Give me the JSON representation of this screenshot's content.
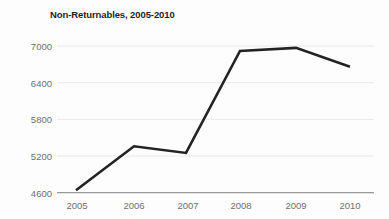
{
  "chart_data": {
    "type": "line",
    "title": "Non-Returnables, 2005-2010",
    "xlabel": "",
    "ylabel": "",
    "categories": [
      "2005",
      "2006",
      "2007",
      "2008",
      "2009",
      "2010"
    ],
    "x": [
      2005,
      2006,
      2007,
      2008,
      2009,
      2010
    ],
    "values": [
      4640,
      5360,
      5250,
      6920,
      6970,
      6660
    ],
    "series": [
      {
        "name": "Non-Returnables",
        "values": [
          4640,
          5360,
          5250,
          6920,
          6970,
          6660
        ]
      }
    ],
    "ylim": [
      4600,
      7000
    ],
    "yticks": [
      4600,
      5200,
      5800,
      6400,
      7000
    ],
    "ytick_labels": [
      "4600",
      "5200",
      "5800",
      "6400",
      "7000"
    ],
    "xtick_labels": [
      "2005",
      "2006",
      "2007",
      "2008",
      "2009",
      "2010"
    ],
    "grid": true,
    "grid_axis": "y",
    "legend": false,
    "legend_position": "none",
    "markers": false,
    "colors": {
      "line": "#232323",
      "grid": "#e9e9e9",
      "axis": "#9a9a9a",
      "tick_text": "#6e6e6e",
      "title_text": "#1d1d1d",
      "background": "#fdfdfd"
    },
    "line_width": 2.6
  },
  "geometry": {
    "plot_left": 57,
    "plot_right": 374,
    "y_top_value_px": 46,
    "y_bottom_value_px": 192.7,
    "point_x": [
      76,
      134,
      186,
      240,
      296,
      350
    ],
    "point_y": [
      190,
      146,
      153,
      51,
      48,
      67
    ],
    "gridline_y": [
      46,
      82.7,
      119.3,
      156,
      192.7
    ],
    "label_x": [
      77,
      134,
      188,
      241,
      296,
      350
    ],
    "x_label_y": 201
  }
}
